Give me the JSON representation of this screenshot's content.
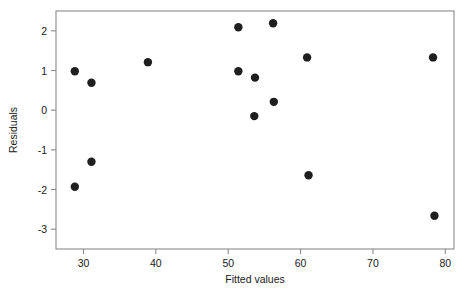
{
  "chart_data": {
    "type": "scatter",
    "title": "",
    "xlabel": "Fitted values",
    "ylabel": "Residuals",
    "xlim": [
      26.2,
      81.2
    ],
    "ylim": [
      -3.5,
      2.5
    ],
    "xticks": [
      30,
      40,
      50,
      60,
      70,
      80
    ],
    "xtick_labels": [
      "30",
      "40",
      "50",
      "60",
      "70",
      "80"
    ],
    "yticks": [
      2,
      1,
      0,
      -1,
      -2,
      -3
    ],
    "ytick_labels": [
      "2",
      "1",
      "0",
      "-1",
      "-2",
      "-3"
    ],
    "grid": false,
    "legend": null,
    "marker": "filled-circle",
    "marker_color": "#1f1f1f",
    "marker_size": 4.2,
    "frame_color": "#8a8a8a",
    "points": [
      {
        "x": 28.8,
        "y": 0.98
      },
      {
        "x": 31.1,
        "y": 0.69
      },
      {
        "x": 28.8,
        "y": -1.93
      },
      {
        "x": 31.1,
        "y": -1.3
      },
      {
        "x": 38.9,
        "y": 1.21
      },
      {
        "x": 51.4,
        "y": 2.09
      },
      {
        "x": 51.4,
        "y": 0.98
      },
      {
        "x": 53.7,
        "y": 0.82
      },
      {
        "x": 53.6,
        "y": -0.15
      },
      {
        "x": 56.2,
        "y": 2.19
      },
      {
        "x": 56.3,
        "y": 0.21
      },
      {
        "x": 60.9,
        "y": 1.33
      },
      {
        "x": 61.1,
        "y": -1.64
      },
      {
        "x": 78.3,
        "y": 1.33
      },
      {
        "x": 78.5,
        "y": -2.66
      }
    ],
    "n_points": 15
  }
}
